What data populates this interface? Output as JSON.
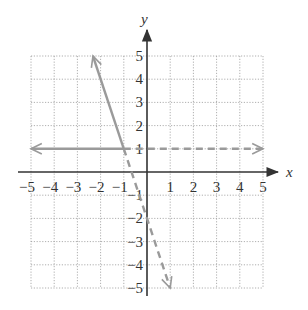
{
  "chart_data": {
    "type": "line",
    "title": "",
    "xlabel": "x",
    "ylabel": "y",
    "xlim": [
      -5,
      5
    ],
    "ylim": [
      -5,
      5
    ],
    "grid": true,
    "x_ticks": [
      "-5",
      "-4",
      "-3",
      "-2",
      "-1",
      "1",
      "2",
      "3",
      "4",
      "5"
    ],
    "y_ticks": [
      "5",
      "4",
      "3",
      "2",
      "1",
      "-1",
      "-2",
      "-3",
      "-4",
      "-5"
    ],
    "series": [
      {
        "name": "y = 1 (x ≤ -1)",
        "style": "solid",
        "points": [
          [
            -1,
            1
          ],
          [
            -5,
            1
          ]
        ],
        "arrow_end": true
      },
      {
        "name": "y = -3x - 2 (x ≤ -1)",
        "style": "solid",
        "points": [
          [
            -1,
            1
          ],
          [
            -2.33,
            5
          ]
        ],
        "arrow_end": true
      },
      {
        "name": "y = 1 (x > -1)",
        "style": "dashed",
        "points": [
          [
            -1,
            1
          ],
          [
            5,
            1
          ]
        ],
        "arrow_end": true
      },
      {
        "name": "y = -3x - 2 (x > -1)",
        "style": "dashed",
        "points": [
          [
            -1,
            1
          ],
          [
            1,
            -5
          ]
        ],
        "arrow_end": true
      }
    ],
    "colors": {
      "axis": "#333333",
      "grid": "#9a9a9a",
      "curve": "#9a9a9a"
    }
  }
}
